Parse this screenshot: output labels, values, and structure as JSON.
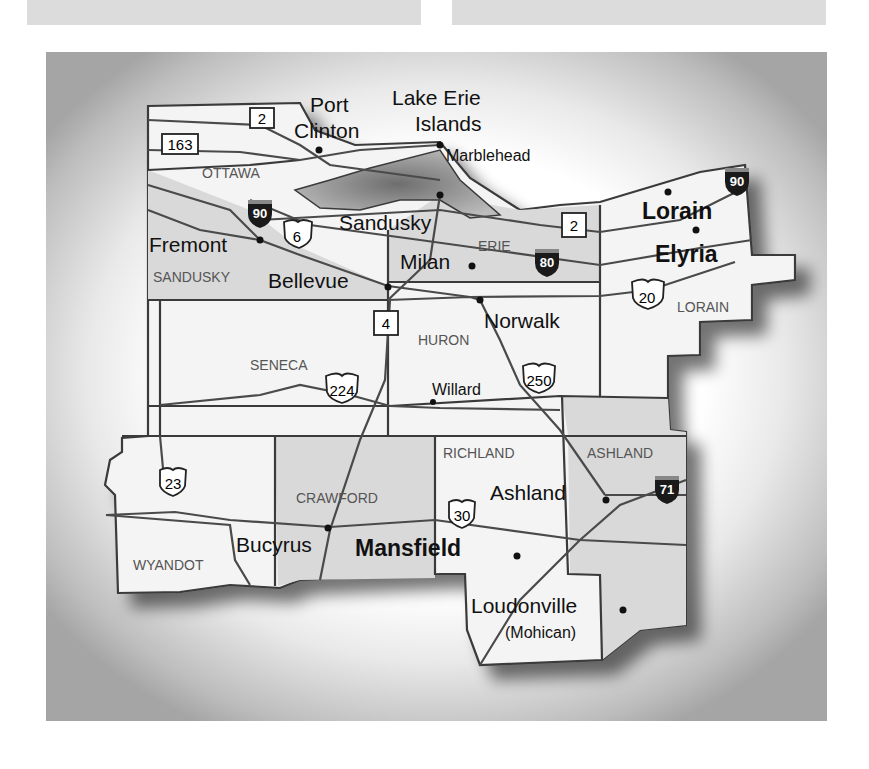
{
  "map": {
    "background_color": "#ffffff",
    "land_color": "#f4f4f4",
    "shaded_county_color": "#d9d9d9",
    "water_color": "#8c8c8c",
    "counties": [
      {
        "name": "OTTAWA",
        "shaded": false
      },
      {
        "name": "SANDUSKY",
        "shaded": true
      },
      {
        "name": "ERIE",
        "shaded": true
      },
      {
        "name": "LORAIN",
        "shaded": false
      },
      {
        "name": "SENECA",
        "shaded": false
      },
      {
        "name": "HURON",
        "shaded": false
      },
      {
        "name": "WYANDOT",
        "shaded": false
      },
      {
        "name": "CRAWFORD",
        "shaded": true
      },
      {
        "name": "RICHLAND",
        "shaded": false
      },
      {
        "name": "ASHLAND",
        "shaded": true
      }
    ],
    "cities": [
      {
        "name": "Port Clinton",
        "line1": "Port",
        "line2": "Clinton"
      },
      {
        "name": "Lake Erie Islands",
        "line1": "Lake Erie",
        "line2": "Islands"
      },
      {
        "name": "Marblehead"
      },
      {
        "name": "Sandusky"
      },
      {
        "name": "Fremont"
      },
      {
        "name": "Bellevue"
      },
      {
        "name": "Milan"
      },
      {
        "name": "Norwalk"
      },
      {
        "name": "Lorain"
      },
      {
        "name": "Elyria"
      },
      {
        "name": "Willard"
      },
      {
        "name": "Bucyrus"
      },
      {
        "name": "Mansfield"
      },
      {
        "name": "Ashland"
      },
      {
        "name": "Loudonville",
        "sub": "(Mohican)"
      }
    ],
    "route_shields": {
      "state": [
        "2",
        "163",
        "4",
        "2"
      ],
      "us": [
        "6",
        "20",
        "224",
        "250",
        "23",
        "30"
      ],
      "interstate": [
        "90",
        "90",
        "80",
        "71"
      ]
    }
  }
}
